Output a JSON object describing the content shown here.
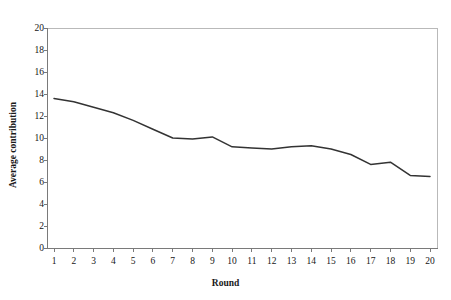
{
  "chart_data": {
    "type": "line",
    "title": "",
    "xlabel": "Round",
    "ylabel": "Average contribution",
    "xlim": [
      1,
      20
    ],
    "ylim": [
      0,
      20
    ],
    "grid": false,
    "legend": false,
    "x": [
      1,
      2,
      3,
      4,
      5,
      6,
      7,
      8,
      9,
      10,
      11,
      12,
      13,
      14,
      15,
      16,
      17,
      18,
      19,
      20
    ],
    "x_tick_labels": [
      "1",
      "2",
      "3",
      "4",
      "5",
      "6",
      "7",
      "8",
      "9",
      "10",
      "11",
      "12",
      "13",
      "14",
      "15",
      "16",
      "17",
      "18",
      "19",
      "20"
    ],
    "y_tick_labels": [
      "0",
      "2",
      "4",
      "6",
      "8",
      "10",
      "12",
      "14",
      "16",
      "18",
      "20"
    ],
    "y_ticks": [
      0,
      2,
      4,
      6,
      8,
      10,
      12,
      14,
      16,
      18,
      20
    ],
    "series": [
      {
        "name": "Average contribution",
        "color": "#333333",
        "values": [
          13.6,
          13.3,
          12.8,
          12.3,
          11.6,
          10.8,
          10.0,
          9.9,
          10.1,
          9.2,
          9.1,
          9.0,
          9.2,
          9.3,
          9.0,
          8.5,
          7.6,
          7.8,
          6.6,
          6.5
        ]
      }
    ]
  },
  "axis": {
    "y_title": "Average contribution",
    "x_title": "Round"
  },
  "style": {
    "line_color": "#333333",
    "axis_color": "#7a7a7a",
    "background": "#ffffff"
  }
}
